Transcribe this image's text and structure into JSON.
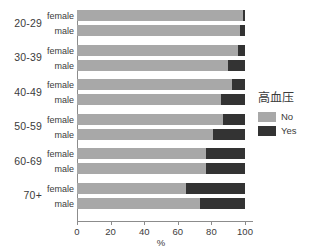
{
  "chart_data": {
    "type": "bar",
    "orientation": "horizontal",
    "stacked": true,
    "stack_mode": "percent",
    "title": "",
    "xlabel": "%",
    "ylabel": "",
    "xlim": [
      0,
      100
    ],
    "xticks": [
      0,
      20,
      40,
      60,
      80,
      100
    ],
    "xtick_labels": [
      "0",
      "20",
      "40",
      "60",
      "80",
      "100"
    ],
    "grid": false,
    "legend": {
      "title": "高血压",
      "position": "right",
      "entries": [
        {
          "label": "No",
          "color": "#a8a8a8"
        },
        {
          "label": "Yes",
          "color": "#333333"
        }
      ]
    },
    "groups": [
      "20-29",
      "30-39",
      "40-49",
      "50-59",
      "60-69",
      "70+"
    ],
    "subgroups": [
      "female",
      "male"
    ],
    "series": [
      {
        "name": "No",
        "color": "#a8a8a8"
      },
      {
        "name": "Yes",
        "color": "#333333"
      }
    ],
    "bars": [
      {
        "group": "20-29",
        "subgroup": "female",
        "no": 99.0,
        "yes": 1.0
      },
      {
        "group": "20-29",
        "subgroup": "male",
        "no": 97.0,
        "yes": 3.0
      },
      {
        "group": "30-39",
        "subgroup": "female",
        "no": 96.0,
        "yes": 4.0
      },
      {
        "group": "30-39",
        "subgroup": "male",
        "no": 90.0,
        "yes": 10.0
      },
      {
        "group": "40-49",
        "subgroup": "female",
        "no": 92.0,
        "yes": 8.0
      },
      {
        "group": "40-49",
        "subgroup": "male",
        "no": 86.0,
        "yes": 14.0
      },
      {
        "group": "50-59",
        "subgroup": "female",
        "no": 87.0,
        "yes": 13.0
      },
      {
        "group": "50-59",
        "subgroup": "male",
        "no": 81.0,
        "yes": 19.0
      },
      {
        "group": "60-69",
        "subgroup": "female",
        "no": 77.0,
        "yes": 23.0
      },
      {
        "group": "60-69",
        "subgroup": "male",
        "no": 77.0,
        "yes": 23.0
      },
      {
        "group": "70+",
        "subgroup": "female",
        "no": 65.0,
        "yes": 35.0
      },
      {
        "group": "70+",
        "subgroup": "male",
        "no": 73.0,
        "yes": 27.0
      }
    ]
  },
  "axis": {
    "x_title": "%",
    "tick_labels": [
      "0",
      "20",
      "40",
      "60",
      "80",
      "100"
    ]
  },
  "legend": {
    "title": "高血压",
    "no_label": "No",
    "yes_label": "Yes"
  },
  "colors": {
    "no": "#a8a8a8",
    "yes": "#333333",
    "axis": "#8c8c8c",
    "text": "#3b3b3b",
    "background": "#ffffff"
  }
}
